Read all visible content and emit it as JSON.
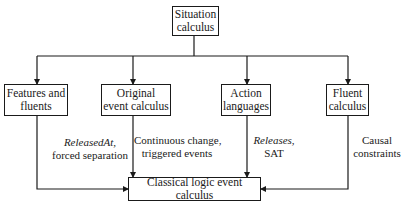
{
  "diagram": {
    "root": {
      "line1": "Situation",
      "line2": "calculus"
    },
    "children": [
      {
        "line1": "Features and",
        "line2": "fluents"
      },
      {
        "line1": "Original",
        "line2": "event calculus"
      },
      {
        "line1": "Action",
        "line2": "languages"
      },
      {
        "line1": "Fluent",
        "line2": "calculus"
      }
    ],
    "target": {
      "label": "Classical logic event calculus"
    },
    "edge_labels": [
      {
        "italic": "ReleasedAt,",
        "normal": "forced separation"
      },
      {
        "line1": "Continuous change,",
        "line2": "triggered events"
      },
      {
        "italic": "Releases,",
        "normal": "SAT"
      },
      {
        "line1": "Causal",
        "line2": "constraints"
      }
    ]
  }
}
